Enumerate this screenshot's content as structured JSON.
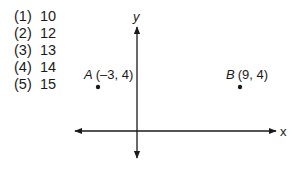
{
  "answer_choices": [
    {
      "label": "(1)",
      "value": "10"
    },
    {
      "label": "(2)",
      "value": "12"
    },
    {
      "label": "(3)",
      "value": "13"
    },
    {
      "label": "(4)",
      "value": "14"
    },
    {
      "label": "(5)",
      "value": "15"
    }
  ],
  "axes": {
    "x_label": "x",
    "y_label": "y"
  },
  "points": [
    {
      "name": "A",
      "coords": "(–3, 4)",
      "x": -3,
      "y": 4
    },
    {
      "name": "B",
      "coords": "(9, 4)",
      "x": 9,
      "y": 4
    }
  ],
  "colors": {
    "ink": "#1a1a1a",
    "background": "#ffffff"
  }
}
